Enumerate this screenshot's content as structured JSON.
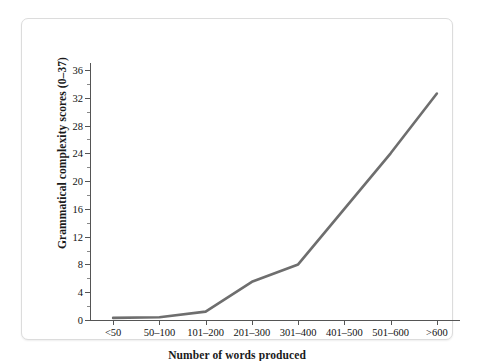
{
  "figure": {
    "frame_color": "#dcdcdc",
    "background": "#ffffff"
  },
  "chart_data": {
    "type": "line",
    "title": "",
    "subtitle": "",
    "xlabel": "Number of words produced",
    "ylabel": "Grammatical complexity scores (0–37)",
    "categories": [
      "<50",
      "50–100",
      "101–200",
      "201–300",
      "301–400",
      "401–500",
      "501–600",
      ">600"
    ],
    "values": [
      0.3,
      0.4,
      1.2,
      5.5,
      8.0,
      16.0,
      24.0,
      32.6
    ],
    "series": [
      {
        "name": "Grammatical complexity",
        "color": "#6e6e6e",
        "values": [
          0.3,
          0.4,
          1.2,
          5.5,
          8.0,
          16.0,
          24.0,
          32.6
        ]
      }
    ],
    "ylim": [
      0,
      37
    ],
    "y_major_ticks": [
      0,
      4,
      8,
      12,
      16,
      20,
      24,
      28,
      32,
      36
    ],
    "y_minor_ticks": [
      2,
      6,
      10,
      14,
      18,
      22,
      26,
      30,
      34
    ],
    "y_tick_labels": [
      "0",
      "4",
      "8",
      "12",
      "16",
      "20",
      "24",
      "28",
      "32",
      "36"
    ],
    "grid": false,
    "legend": "none",
    "line_color": "#6e6e6e",
    "line_width": 2.6,
    "axis_color": "#555555"
  }
}
